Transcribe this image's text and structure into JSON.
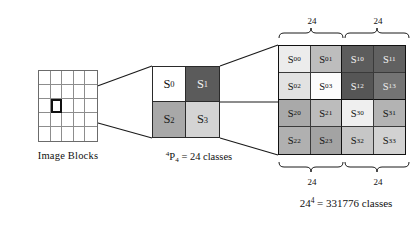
{
  "diagram": {
    "left": {
      "caption": "Image Blocks",
      "grid_rows": 5,
      "grid_cols": 5,
      "selected_cell": {
        "row": 2,
        "col": 1
      }
    },
    "middle": {
      "caption_prefix": "4",
      "caption_base": "P",
      "caption_sub": "4",
      "caption_rest": " = 24 classes",
      "caption_full": "4P4 = 24 classes",
      "cells": [
        {
          "name": "S0",
          "base": "S",
          "sub": "0",
          "fill": "#ffffff",
          "text": "#111111"
        },
        {
          "name": "S1",
          "base": "S",
          "sub": "1",
          "fill": "#5b5b5b",
          "text": "#f2f2f2"
        },
        {
          "name": "S2",
          "base": "S",
          "sub": "2",
          "fill": "#a8a8a8",
          "text": "#1a1a1a"
        },
        {
          "name": "S3",
          "base": "S",
          "sub": "3",
          "fill": "#d4d4d4",
          "text": "#1a1a1a"
        }
      ]
    },
    "right": {
      "cells": [
        {
          "name": "S00",
          "base": "S",
          "sub": "00",
          "fill": "#ececec",
          "text": "#111111"
        },
        {
          "name": "S01",
          "base": "S",
          "sub": "01",
          "fill": "#bdbdbd",
          "text": "#111111"
        },
        {
          "name": "S10",
          "base": "S",
          "sub": "10",
          "fill": "#5c5c5c",
          "text": "#f5f5f5"
        },
        {
          "name": "S11",
          "base": "S",
          "sub": "11",
          "fill": "#616161",
          "text": "#f5f5f5"
        },
        {
          "name": "S02",
          "base": "S",
          "sub": "02",
          "fill": "#e2e2e2",
          "text": "#111111"
        },
        {
          "name": "S03",
          "base": "S",
          "sub": "03",
          "fill": "#fcfcfc",
          "text": "#111111"
        },
        {
          "name": "S12",
          "base": "S",
          "sub": "12",
          "fill": "#565656",
          "text": "#f5f5f5"
        },
        {
          "name": "S13",
          "base": "S",
          "sub": "13",
          "fill": "#747474",
          "text": "#efefef"
        },
        {
          "name": "S20",
          "base": "S",
          "sub": "20",
          "fill": "#a9a9a9",
          "text": "#111111"
        },
        {
          "name": "S21",
          "base": "S",
          "sub": "21",
          "fill": "#bcbcbc",
          "text": "#111111"
        },
        {
          "name": "S30",
          "base": "S",
          "sub": "30",
          "fill": "#efefef",
          "text": "#111111"
        },
        {
          "name": "S31",
          "base": "S",
          "sub": "31",
          "fill": "#b3b3b3",
          "text": "#111111"
        },
        {
          "name": "S22",
          "base": "S",
          "sub": "22",
          "fill": "#b0b0b0",
          "text": "#111111"
        },
        {
          "name": "S23",
          "base": "S",
          "sub": "23",
          "fill": "#a3a3a3",
          "text": "#111111"
        },
        {
          "name": "S32",
          "base": "S",
          "sub": "32",
          "fill": "#c6c6c6",
          "text": "#111111"
        },
        {
          "name": "S33",
          "base": "S",
          "sub": "33",
          "fill": "#d2d2d2",
          "text": "#111111"
        }
      ],
      "brace_top_left_label": "24",
      "brace_top_right_label": "24",
      "brace_bottom_left_label": "24",
      "brace_bottom_right_label": "24",
      "total_base": "24",
      "total_exp": "4",
      "total_rest": " = 331776 classes",
      "total_full": "24^4 = 331776 classes"
    },
    "colors": {
      "line": "#1a1a1a",
      "grid_line": "#8d8d8d",
      "background": "#ffffff"
    }
  }
}
